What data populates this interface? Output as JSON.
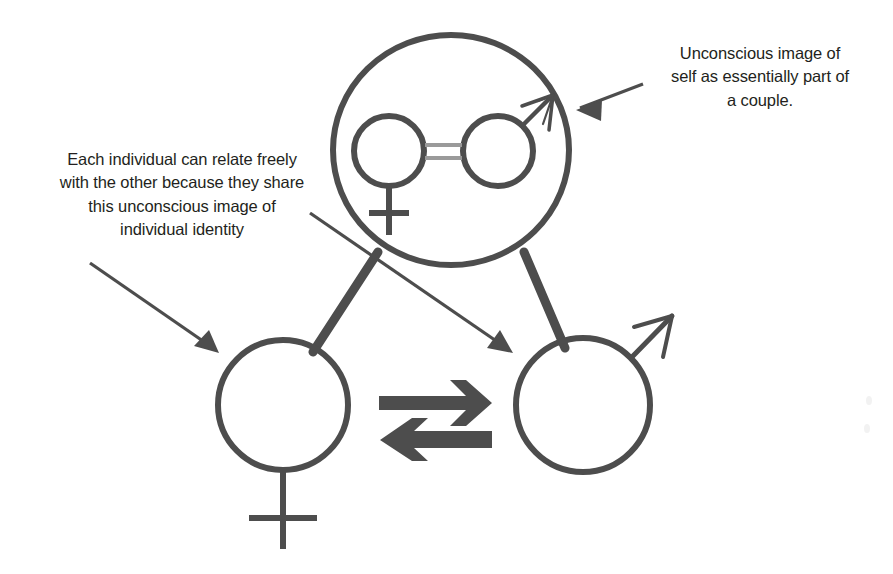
{
  "diagram": {
    "colors": {
      "stroke": "#4d4d4d",
      "text": "#231f20",
      "inner_link": "#8c8c8c",
      "background": "#ffffff"
    },
    "annotations": [
      {
        "id": "couple",
        "text": "Unconscious image of\nself as essentially part of\na couple.",
        "points_to": "couple-circle"
      },
      {
        "id": "identity",
        "text": "Each individual can relate freely\nwith the other because they share\nthis unconscious image of\nindividual identity",
        "points_to": "individual-circles"
      }
    ],
    "nodes": [
      {
        "id": "couple-circle",
        "label": "",
        "symbol": "couple-of-female-and-male",
        "description": "Large circle containing a female symbol circle and a male symbol circle joined by a double link"
      },
      {
        "id": "inner-female",
        "label": "",
        "symbol": "female-symbol"
      },
      {
        "id": "inner-male",
        "label": "",
        "symbol": "male-symbol"
      },
      {
        "id": "individual-female",
        "label": "",
        "symbol": "female-symbol"
      },
      {
        "id": "individual-male",
        "label": "",
        "symbol": "male-symbol"
      }
    ],
    "connectors": [
      {
        "id": "couple-to-female",
        "from": "couple-circle",
        "to": "individual-female",
        "style": "thick-line"
      },
      {
        "id": "couple-to-male",
        "from": "couple-circle",
        "to": "individual-male",
        "style": "thick-line"
      },
      {
        "id": "inner-pair-link",
        "from": "inner-female",
        "to": "inner-male",
        "style": "double-gray-line"
      },
      {
        "id": "relate-forward",
        "from": "individual-female",
        "to": "individual-male",
        "style": "block-arrow-right"
      },
      {
        "id": "relate-back",
        "from": "individual-male",
        "to": "individual-female",
        "style": "block-arrow-left"
      }
    ]
  }
}
